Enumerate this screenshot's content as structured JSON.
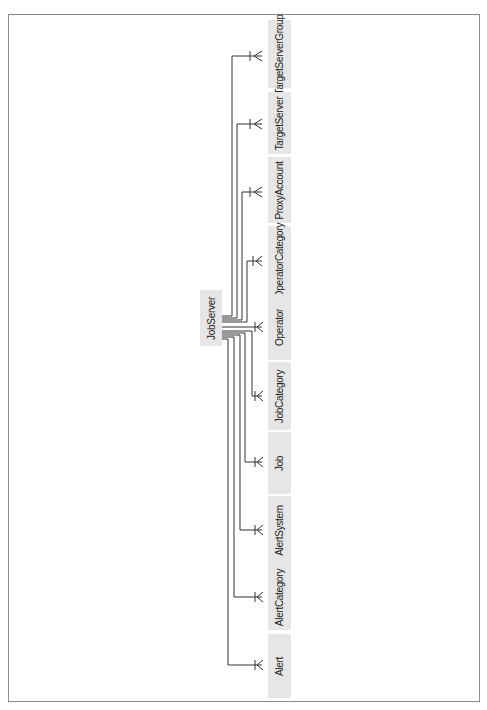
{
  "diagram": {
    "root": {
      "label": "JobServer"
    },
    "children": [
      {
        "label": "TargetServerGroup"
      },
      {
        "label": "TargetServer"
      },
      {
        "label": "ProxyAccount"
      },
      {
        "label": "OperatorCategory"
      },
      {
        "label": "Operator"
      },
      {
        "label": "JobCategory"
      },
      {
        "label": "Job"
      },
      {
        "label": "AlertSystem"
      },
      {
        "label": "AlertCategory"
      },
      {
        "label": "Alert"
      }
    ],
    "relationship": "one-to-many"
  },
  "colors": {
    "box_fill": "#e6e6e6",
    "line": "#333333",
    "frame": "#8a8a8a"
  }
}
